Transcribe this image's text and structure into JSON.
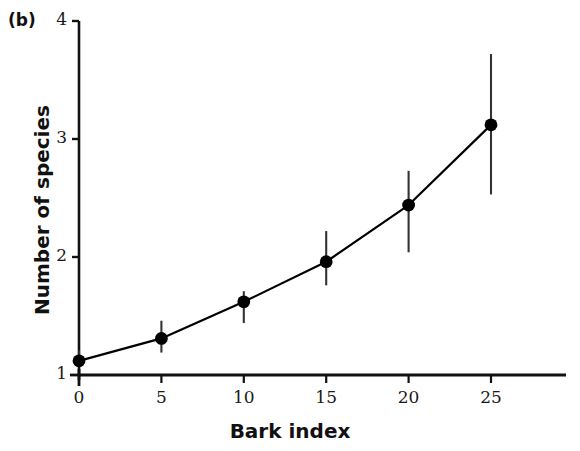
{
  "figure": {
    "panel_label": "(b)",
    "background_color": "#ffffff",
    "ink_color": "#111111"
  },
  "chart_data": {
    "type": "line",
    "title": "",
    "subtitle": "",
    "panel": "(b)",
    "xlabel": "Bark index",
    "ylabel": "Number of species",
    "xlim": [
      0,
      30.5
    ],
    "ylim": [
      1,
      4
    ],
    "grid": false,
    "legend": null,
    "xticks": [
      0,
      5,
      10,
      15,
      20,
      25
    ],
    "xtick_labels": [
      "0",
      "5",
      "10",
      "15",
      "20",
      "25"
    ],
    "yticks": [
      1,
      2,
      3,
      4
    ],
    "ytick_labels": [
      "1",
      "2",
      "3",
      "4"
    ],
    "marker": "filled-circle",
    "marker_color": "#000000",
    "line_color": "#000000",
    "errorbar_color": "#333333",
    "errorbar_caps": false,
    "x": [
      0,
      5,
      10,
      15,
      20,
      25
    ],
    "y": [
      1.12,
      1.31,
      1.62,
      1.96,
      2.44,
      3.12
    ],
    "y_err_low": [
      1.12,
      1.19,
      1.44,
      1.76,
      2.04,
      2.53
    ],
    "y_err_high": [
      1.21,
      1.46,
      1.71,
      2.22,
      2.73,
      3.72
    ],
    "series": [
      {
        "name": "Number of species",
        "x": [
          0,
          5,
          10,
          15,
          20,
          25
        ],
        "values": [
          1.12,
          1.31,
          1.62,
          1.96,
          2.44,
          3.12
        ],
        "err_low": [
          1.12,
          1.19,
          1.44,
          1.76,
          2.04,
          2.53
        ],
        "err_high": [
          1.21,
          1.46,
          1.71,
          2.22,
          2.73,
          3.72
        ]
      }
    ]
  }
}
